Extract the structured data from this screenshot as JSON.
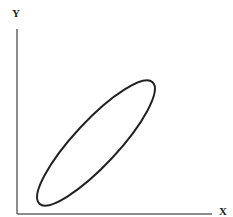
{
  "diagram": {
    "y_axis_label": "Y",
    "x_axis_label": "X",
    "shape": "elongated-ellipse",
    "orientation": "positive-diagonal",
    "colors": {
      "axis": "#555555",
      "curve": "#222222",
      "background": "#ffffff"
    }
  }
}
